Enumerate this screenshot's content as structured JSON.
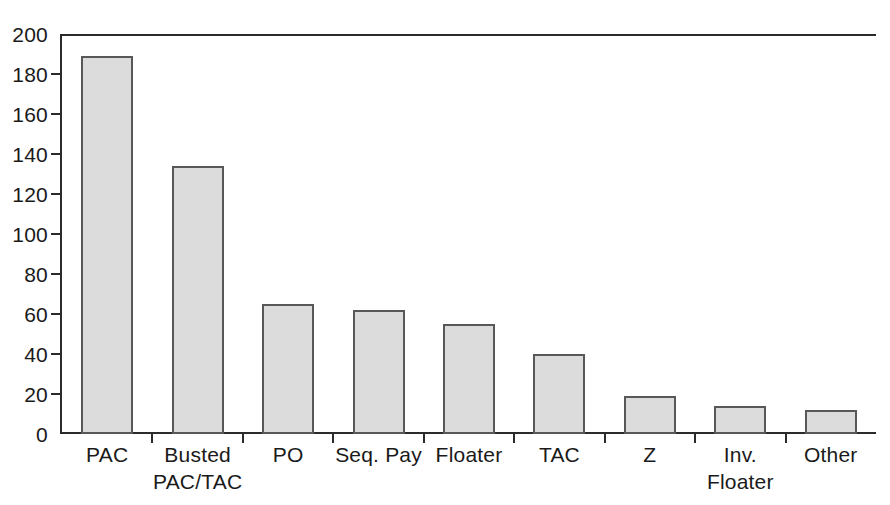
{
  "chart_data": {
    "type": "bar",
    "title": "",
    "subtitle": "",
    "xlabel": "",
    "ylabel": "",
    "ylim": [
      0,
      200
    ],
    "ytick_step": 20,
    "grid": false,
    "legend": false,
    "categories": [
      "PAC",
      "Busted PAC/TAC",
      "PO",
      "Seq. Pay",
      "Floater",
      "TAC",
      "Z",
      "Inv. Floater",
      "Other"
    ],
    "category_labels": [
      {
        "line1": "PAC",
        "line2": ""
      },
      {
        "line1": "Busted",
        "line2": "PAC/TAC"
      },
      {
        "line1": "PO",
        "line2": ""
      },
      {
        "line1": "Seq. Pay",
        "line2": ""
      },
      {
        "line1": "Floater",
        "line2": ""
      },
      {
        "line1": "TAC",
        "line2": ""
      },
      {
        "line1": "Z",
        "line2": ""
      },
      {
        "line1": "Inv.",
        "line2": "Floater"
      },
      {
        "line1": "Other",
        "line2": ""
      }
    ],
    "values": [
      189,
      134,
      65,
      62,
      55,
      40,
      19,
      14,
      12
    ],
    "ytick_labels": [
      "200",
      "180",
      "160",
      "140",
      "120",
      "100",
      "80",
      "60",
      "40",
      "20",
      "0"
    ],
    "ytick_values": [
      200,
      180,
      160,
      140,
      120,
      100,
      80,
      60,
      40,
      20,
      0
    ],
    "colors": {
      "bar_fill": "#dcdcdc",
      "bar_border": "#58585a",
      "axis": "#2b2b2b",
      "text": "#1a1a1a",
      "background": "#ffffff"
    }
  }
}
